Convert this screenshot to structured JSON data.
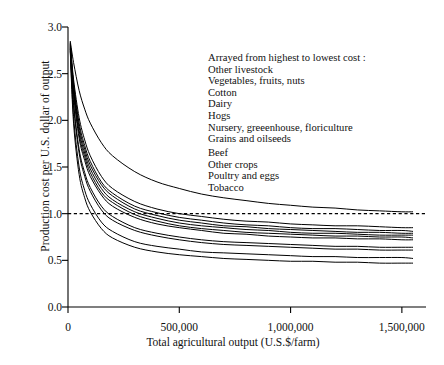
{
  "chart_data": {
    "type": "line",
    "title": "",
    "xlabel": "Total agricultural output (U.S.$/farm)",
    "ylabel": "Production cost per U.S. dollar of output",
    "xlim": [
      0,
      1550000
    ],
    "ylim": [
      0.0,
      3.0
    ],
    "xticks": [
      0,
      500000,
      1000000,
      1500000
    ],
    "xticklabels": [
      "0",
      "500,000",
      "1,000,000",
      "1,500,000"
    ],
    "yticks": [
      0.0,
      0.5,
      1.0,
      1.5,
      2.0,
      2.5,
      3.0
    ],
    "yticklabels": [
      "0.0",
      "0.5",
      "1.0",
      "1.5",
      "2.0",
      "2.5",
      "3.0"
    ],
    "grid": false,
    "legend_position": "upper-right-inside",
    "legend_style": "text-list-no-keys",
    "reference_lines": [
      {
        "name": "break-even-line",
        "orientation": "horizontal",
        "value": 1.0,
        "style": "dashed",
        "color": "#000000"
      }
    ],
    "annotation": "Arrayed from highest to lowest cost :",
    "series_note": "All curves are hyperbolic decay curves starting near 2.85 at the smallest farm output and flattening to distinct asymptotes at large output.",
    "series": [
      {
        "name": "Other livestock",
        "rank": 1,
        "x": [
          10000,
          25000,
          50000,
          75000,
          100000,
          150000,
          200000,
          300000,
          400000,
          500000,
          600000,
          700000,
          800000,
          900000,
          1000000,
          1100000,
          1200000,
          1300000,
          1400000,
          1500000,
          1550000
        ],
        "values": [
          2.85,
          2.62,
          2.32,
          2.12,
          1.97,
          1.76,
          1.62,
          1.45,
          1.34,
          1.27,
          1.21,
          1.17,
          1.14,
          1.11,
          1.09,
          1.07,
          1.06,
          1.04,
          1.03,
          1.02,
          1.02
        ]
      },
      {
        "name": "Vegetables, fruits, nuts",
        "rank": 2,
        "x": [
          10000,
          25000,
          50000,
          75000,
          100000,
          150000,
          200000,
          300000,
          400000,
          500000,
          600000,
          700000,
          800000,
          900000,
          1000000,
          1100000,
          1200000,
          1300000,
          1400000,
          1500000,
          1550000
        ],
        "values": [
          2.84,
          2.44,
          2.03,
          1.79,
          1.62,
          1.4,
          1.27,
          1.13,
          1.05,
          1.0,
          0.97,
          0.94,
          0.92,
          0.91,
          0.89,
          0.88,
          0.87,
          0.87,
          0.86,
          0.85,
          0.85
        ]
      },
      {
        "name": "Cotton",
        "rank": 3,
        "x": [
          10000,
          25000,
          50000,
          75000,
          100000,
          150000,
          200000,
          300000,
          400000,
          500000,
          600000,
          700000,
          800000,
          900000,
          1000000,
          1100000,
          1200000,
          1300000,
          1400000,
          1500000,
          1550000
        ],
        "values": [
          2.83,
          2.4,
          1.97,
          1.73,
          1.56,
          1.34,
          1.22,
          1.08,
          1.01,
          0.96,
          0.93,
          0.9,
          0.88,
          0.87,
          0.85,
          0.84,
          0.84,
          0.83,
          0.82,
          0.82,
          0.81
        ]
      },
      {
        "name": "Dairy",
        "rank": 4,
        "x": [
          10000,
          25000,
          50000,
          75000,
          100000,
          150000,
          200000,
          300000,
          400000,
          500000,
          600000,
          700000,
          800000,
          900000,
          1000000,
          1100000,
          1200000,
          1300000,
          1400000,
          1500000,
          1550000
        ],
        "values": [
          2.82,
          2.37,
          1.93,
          1.69,
          1.52,
          1.31,
          1.19,
          1.05,
          0.98,
          0.93,
          0.9,
          0.87,
          0.86,
          0.84,
          0.83,
          0.82,
          0.81,
          0.8,
          0.8,
          0.79,
          0.79
        ]
      },
      {
        "name": "Hogs",
        "rank": 5,
        "x": [
          10000,
          25000,
          50000,
          75000,
          100000,
          150000,
          200000,
          300000,
          400000,
          500000,
          600000,
          700000,
          800000,
          900000,
          1000000,
          1100000,
          1200000,
          1300000,
          1400000,
          1500000,
          1550000
        ],
        "values": [
          2.81,
          2.34,
          1.89,
          1.65,
          1.48,
          1.27,
          1.15,
          1.02,
          0.95,
          0.9,
          0.87,
          0.85,
          0.83,
          0.82,
          0.8,
          0.79,
          0.79,
          0.78,
          0.77,
          0.77,
          0.77
        ]
      },
      {
        "name": "Nursery, greeenhouse, floriculture",
        "rank": 6,
        "x": [
          10000,
          25000,
          50000,
          75000,
          100000,
          150000,
          200000,
          300000,
          400000,
          500000,
          600000,
          700000,
          800000,
          900000,
          1000000,
          1100000,
          1200000,
          1300000,
          1400000,
          1500000,
          1550000
        ],
        "values": [
          2.8,
          2.31,
          1.85,
          1.61,
          1.44,
          1.23,
          1.12,
          0.99,
          0.92,
          0.87,
          0.84,
          0.82,
          0.8,
          0.79,
          0.78,
          0.77,
          0.76,
          0.76,
          0.75,
          0.75,
          0.74
        ]
      },
      {
        "name": "Grains and oilseeds",
        "rank": 7,
        "x": [
          10000,
          25000,
          50000,
          75000,
          100000,
          150000,
          200000,
          300000,
          400000,
          500000,
          600000,
          700000,
          800000,
          900000,
          1000000,
          1100000,
          1200000,
          1300000,
          1400000,
          1500000,
          1550000
        ],
        "values": [
          2.79,
          2.28,
          1.81,
          1.57,
          1.4,
          1.2,
          1.08,
          0.96,
          0.89,
          0.85,
          0.82,
          0.79,
          0.78,
          0.76,
          0.75,
          0.74,
          0.74,
          0.73,
          0.73,
          0.72,
          0.72
        ]
      },
      {
        "name": "Beef",
        "rank": 8,
        "x": [
          10000,
          25000,
          50000,
          75000,
          100000,
          150000,
          200000,
          300000,
          400000,
          500000,
          600000,
          700000,
          800000,
          900000,
          1000000,
          1100000,
          1200000,
          1300000,
          1400000,
          1500000,
          1550000
        ],
        "values": [
          2.78,
          2.19,
          1.69,
          1.44,
          1.28,
          1.08,
          0.97,
          0.85,
          0.79,
          0.75,
          0.72,
          0.7,
          0.69,
          0.68,
          0.67,
          0.66,
          0.65,
          0.65,
          0.64,
          0.64,
          0.64
        ]
      },
      {
        "name": "Other crops",
        "rank": 9,
        "x": [
          10000,
          25000,
          50000,
          75000,
          100000,
          150000,
          200000,
          300000,
          400000,
          500000,
          600000,
          700000,
          800000,
          900000,
          1000000,
          1100000,
          1200000,
          1300000,
          1400000,
          1500000,
          1550000
        ],
        "values": [
          2.77,
          2.16,
          1.65,
          1.4,
          1.24,
          1.04,
          0.93,
          0.82,
          0.76,
          0.72,
          0.69,
          0.67,
          0.66,
          0.65,
          0.64,
          0.63,
          0.62,
          0.62,
          0.61,
          0.61,
          0.61
        ]
      },
      {
        "name": "Poultry and eggs",
        "rank": 10,
        "x": [
          10000,
          25000,
          50000,
          75000,
          100000,
          150000,
          200000,
          300000,
          400000,
          500000,
          600000,
          700000,
          800000,
          900000,
          1000000,
          1100000,
          1200000,
          1300000,
          1400000,
          1500000,
          1550000
        ],
        "values": [
          2.76,
          2.04,
          1.5,
          1.25,
          1.1,
          0.91,
          0.81,
          0.7,
          0.65,
          0.62,
          0.59,
          0.58,
          0.57,
          0.56,
          0.55,
          0.54,
          0.54,
          0.53,
          0.53,
          0.53,
          0.52
        ]
      },
      {
        "name": "Tobacco",
        "rank": 11,
        "x": [
          10000,
          25000,
          50000,
          75000,
          100000,
          150000,
          200000,
          300000,
          400000,
          500000,
          600000,
          700000,
          800000,
          900000,
          1000000,
          1100000,
          1200000,
          1300000,
          1400000,
          1500000,
          1550000
        ],
        "values": [
          2.74,
          1.97,
          1.42,
          1.17,
          1.02,
          0.84,
          0.74,
          0.64,
          0.59,
          0.56,
          0.54,
          0.52,
          0.51,
          0.5,
          0.49,
          0.49,
          0.48,
          0.48,
          0.47,
          0.47,
          0.47
        ]
      }
    ]
  },
  "legend": {
    "heading": "Arrayed from highest to lowest cost :",
    "items": [
      "Other livestock",
      "Vegetables, fruits, nuts",
      "Cotton",
      "Dairy",
      "Hogs",
      "Nursery, greeenhouse, floriculture",
      "Grains and oilseeds",
      "Beef",
      "Other crops",
      "Poultry and eggs",
      "Tobacco"
    ]
  },
  "axes": {
    "x_title": "Total agricultural output (U.S.$/farm)",
    "y_title": "Production cost per U.S. dollar of output",
    "x_tick_labels": [
      "0",
      "500,000",
      "1,000,000",
      "1,500,000"
    ],
    "y_tick_labels": [
      "0.0",
      "0.5",
      "1.0",
      "1.5",
      "2.0",
      "2.5",
      "3.0"
    ]
  },
  "colors": {
    "line": "#000000",
    "axis": "#000000",
    "background": "#ffffff",
    "reference_line": "#000000"
  }
}
